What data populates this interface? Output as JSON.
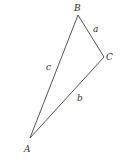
{
  "diagram": {
    "type": "triangle",
    "stroke_color": "#555555",
    "vertices": [
      {
        "name": "A",
        "label": "A"
      },
      {
        "name": "B",
        "label": "B"
      },
      {
        "name": "C",
        "label": "C"
      }
    ],
    "sides": [
      {
        "name": "a",
        "label": "a",
        "between": [
          "B",
          "C"
        ]
      },
      {
        "name": "b",
        "label": "b",
        "between": [
          "A",
          "C"
        ]
      },
      {
        "name": "c",
        "label": "c",
        "between": [
          "A",
          "B"
        ]
      }
    ]
  }
}
